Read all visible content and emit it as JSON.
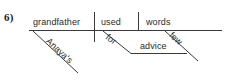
{
  "page": {
    "item_number": "6)",
    "background_color": "#ffffff",
    "line_color": "#3a3a3a",
    "text_color": "#2a2a2a"
  },
  "diagram": {
    "type": "reed-kellogg-sentence-diagram",
    "sentence": "Anaya's grandfather used few words for advice",
    "baseline": {
      "subject": "grandfather",
      "verb": "used",
      "direct_object": "words"
    },
    "modifiers": [
      {
        "word": "Anaya's",
        "modifies": "grandfather",
        "slant": "diagonal"
      },
      {
        "word": "few",
        "modifies": "words",
        "slant": "diagonal"
      }
    ],
    "prepositional_phrase": {
      "preposition": "for",
      "object": "advice"
    }
  },
  "labels": {
    "subject": "grandfather",
    "verb": "used",
    "object": "words",
    "possessive": "Anaya's",
    "preposition": "for",
    "prep_object": "advice",
    "adjective": "few"
  }
}
